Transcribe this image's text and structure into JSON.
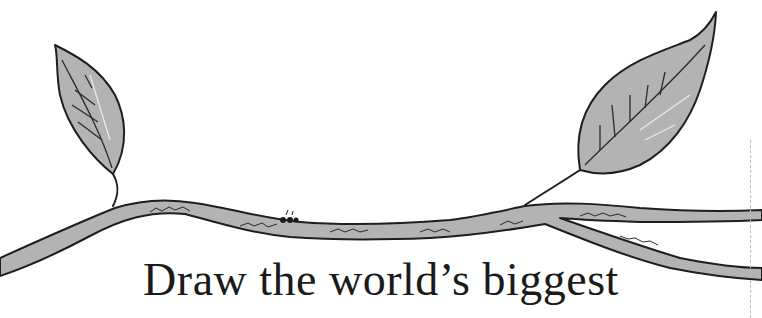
{
  "page": {
    "headline": "Draw the world’s biggest"
  },
  "illustration": {
    "subject": "branch-with-two-leaves-and-tiny-ant",
    "colors": {
      "fill": "#b3b3b3",
      "outline": "#1e1e1e",
      "highlight": "#e6e6e6",
      "background": "#ffffff"
    }
  }
}
